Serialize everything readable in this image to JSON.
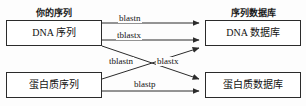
{
  "diagram": {
    "type": "flow-diagram",
    "headers": {
      "left": "你的序列",
      "right": "序列数据库"
    },
    "nodes": [
      {
        "id": "dna-sequence",
        "label": "DNA 序列",
        "column": "left",
        "row": "top"
      },
      {
        "id": "dna-database",
        "label": "DNA 数据库",
        "column": "right",
        "row": "top"
      },
      {
        "id": "protein-sequence",
        "label": "蛋白质序列",
        "column": "left",
        "row": "bottom"
      },
      {
        "id": "protein-database",
        "label": "蛋白质数据库",
        "column": "right",
        "row": "bottom"
      }
    ],
    "edges": [
      {
        "id": "blastn",
        "label": "blastn",
        "from": "dna-sequence",
        "to": "dna-database"
      },
      {
        "id": "tblastx",
        "label": "tblastx",
        "from": "dna-sequence",
        "to": "dna-database"
      },
      {
        "id": "blastx",
        "label": "blastx",
        "from": "dna-sequence",
        "to": "protein-database"
      },
      {
        "id": "tblastn",
        "label": "tblastn",
        "from": "protein-sequence",
        "to": "dna-database"
      },
      {
        "id": "blastp",
        "label": "blastp",
        "from": "protein-sequence",
        "to": "protein-database"
      }
    ],
    "colors": {
      "background": "#fdfdfd",
      "box_border": "#2b2b2b",
      "box_fill": "#ffffff",
      "line": "#2b2b2b",
      "text": "#111111"
    }
  }
}
